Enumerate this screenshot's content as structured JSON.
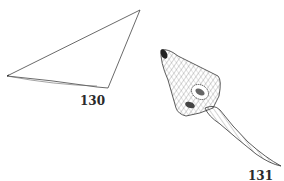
{
  "plate": {
    "background": "#ffffff",
    "ink_color": "#333333"
  },
  "figures": [
    {
      "id": "fig-130",
      "label": "130",
      "description": "triangular outline specimen"
    },
    {
      "id": "fig-131",
      "label": "131",
      "description": "cross-hatched specimen with elongated tapering stalk"
    }
  ]
}
